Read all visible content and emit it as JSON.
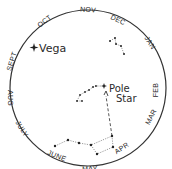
{
  "diagram": {
    "colors": {
      "ink": "#2a2a2a",
      "background": "#ffffff"
    },
    "months": [
      {
        "label": "OCT",
        "x": 46,
        "y": 23,
        "rotate": -38
      },
      {
        "label": "NOV",
        "x": 88,
        "y": 13,
        "rotate": 5
      },
      {
        "label": "DEC",
        "x": 117,
        "y": 24,
        "rotate": 25
      },
      {
        "label": "JAN",
        "x": 147,
        "y": 44,
        "rotate": 58
      },
      {
        "label": "FEB",
        "x": 159,
        "y": 88,
        "rotate": 90
      },
      {
        "label": "MAR",
        "x": 150,
        "y": 115,
        "rotate": -62
      },
      {
        "label": "APR",
        "x": 125,
        "y": 150,
        "rotate": -33
      },
      {
        "label": "MAY",
        "x": 92,
        "y": 163,
        "rotate": -3
      },
      {
        "label": "JUNE",
        "x": 57,
        "y": 154,
        "rotate": 22
      },
      {
        "label": "JULY",
        "x": 27,
        "y": 129,
        "rotate": 55
      },
      {
        "label": "AUG",
        "x": 14,
        "y": 97,
        "rotate": 90
      },
      {
        "label": "SEPT",
        "x": 16,
        "y": 60,
        "rotate": -75
      }
    ],
    "labels": {
      "vega": "Vega",
      "pole": "Pole",
      "star": "Star"
    }
  }
}
